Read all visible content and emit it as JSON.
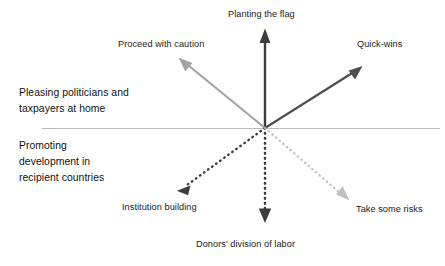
{
  "diagram": {
    "origin": {
      "x": 265,
      "y": 128
    },
    "divider": {
      "name": "horizontal-divider",
      "x1": 42,
      "x2": 440,
      "y": 128,
      "color": "#b9b9b9"
    },
    "regions": {
      "upper": {
        "lines": [
          "Pleasing politicians and",
          "taxpayers at home"
        ]
      },
      "lower": {
        "lines": [
          "Promoting",
          "development in",
          "recipient countries"
        ]
      }
    },
    "arrows": [
      {
        "id": "planting-the-flag",
        "label": "Planting the flag",
        "direction": "up",
        "style": "solid",
        "color": "#3c3c3c",
        "tip": {
          "x": 265,
          "y": 29
        }
      },
      {
        "id": "proceed-with-caution",
        "label": "Proceed with caution",
        "direction": "up-left",
        "style": "solid",
        "color": "#a3a3a3",
        "tip": {
          "x": 179,
          "y": 59
        }
      },
      {
        "id": "quick-wins",
        "label": "Quick-wins",
        "direction": "up-right",
        "style": "solid",
        "color": "#4e4e4e",
        "tip": {
          "x": 362,
          "y": 66
        }
      },
      {
        "id": "institution-building",
        "label": "Institution building",
        "direction": "down-left",
        "style": "dotted",
        "color": "#3c3c3c",
        "tip": {
          "x": 177,
          "y": 190
        }
      },
      {
        "id": "donors-division-of-labor",
        "label": "Donors' division of labor",
        "direction": "down",
        "style": "dotted",
        "color": "#3c3c3c",
        "tip": {
          "x": 265,
          "y": 223
        }
      },
      {
        "id": "take-some-risks",
        "label": "Take some risks",
        "direction": "down-right",
        "style": "dotted",
        "color": "#c0c0c0",
        "tip": {
          "x": 349,
          "y": 200
        }
      }
    ]
  }
}
